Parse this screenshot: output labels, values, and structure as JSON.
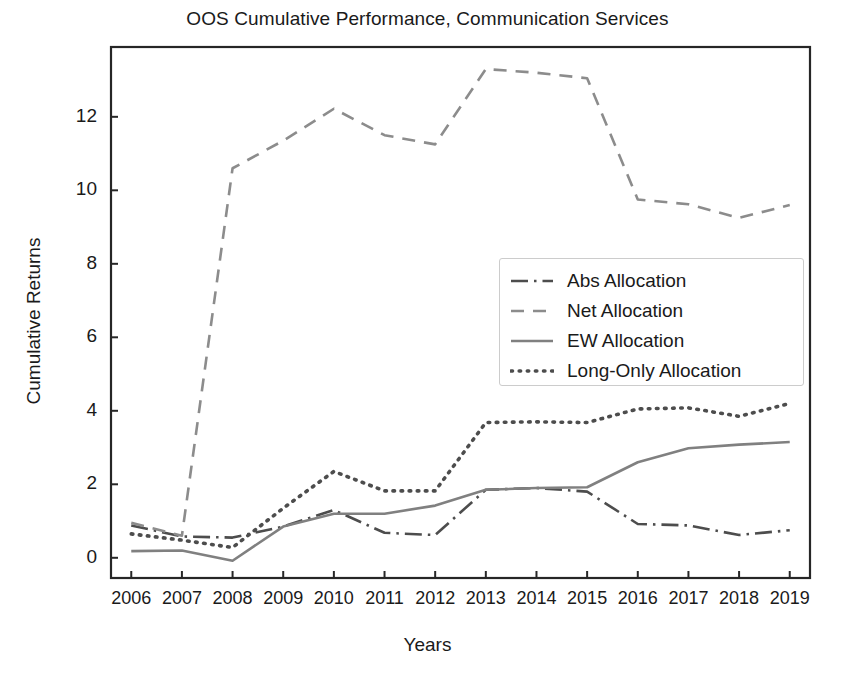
{
  "chart_data": {
    "type": "line",
    "title": "OOS Cumulative Performance, Communication Services",
    "xlabel": "Years",
    "ylabel": "Cumulative Returns",
    "x": [
      2006,
      2007,
      2008,
      2009,
      2010,
      2011,
      2012,
      2013,
      2014,
      2015,
      2016,
      2017,
      2018,
      2019
    ],
    "categories": [
      "2006",
      "2007",
      "2008",
      "2009",
      "2010",
      "2011",
      "2012",
      "2013",
      "2014",
      "2015",
      "2016",
      "2017",
      "2018",
      "2019"
    ],
    "xtick_labels": [
      "2006",
      "2007",
      "2008",
      "2009",
      "2010",
      "2011",
      "2012",
      "2013",
      "2014",
      "2015",
      "2016",
      "2017",
      "2018",
      "2019"
    ],
    "ytick_labels": [
      "0",
      "2",
      "4",
      "6",
      "8",
      "10",
      "12"
    ],
    "yticks": [
      0,
      2,
      4,
      6,
      8,
      10,
      12
    ],
    "xlim": [
      2005.6,
      2019.4
    ],
    "ylim": [
      -0.55,
      13.9
    ],
    "grid": false,
    "legend_position": "center right",
    "series": [
      {
        "name": "Abs Allocation",
        "style": "dashdot",
        "color": "#4d4d4d",
        "values": [
          0.88,
          0.58,
          0.55,
          0.85,
          1.3,
          0.68,
          0.62,
          1.85,
          1.9,
          1.8,
          0.92,
          0.88,
          0.62,
          0.75
        ]
      },
      {
        "name": "Net Allocation",
        "style": "dashed",
        "color": "#8c8c8c",
        "values": [
          0.95,
          0.6,
          10.6,
          11.35,
          12.22,
          11.5,
          11.25,
          13.3,
          13.2,
          13.05,
          9.75,
          9.62,
          9.25,
          9.6
        ]
      },
      {
        "name": "EW Allocation",
        "style": "solid",
        "color": "#808080",
        "values": [
          0.18,
          0.2,
          -0.08,
          0.85,
          1.2,
          1.2,
          1.42,
          1.85,
          1.9,
          1.92,
          2.6,
          2.98,
          3.08,
          3.15
        ]
      },
      {
        "name": "Long-Only Allocation",
        "style": "dotted",
        "color": "#4d4d4d",
        "values": [
          0.65,
          0.48,
          0.28,
          1.35,
          2.35,
          1.82,
          1.82,
          3.68,
          3.7,
          3.68,
          4.05,
          4.08,
          3.85,
          4.2
        ]
      }
    ]
  },
  "axes": {
    "frame_color": "#262626",
    "background": "#ffffff"
  }
}
